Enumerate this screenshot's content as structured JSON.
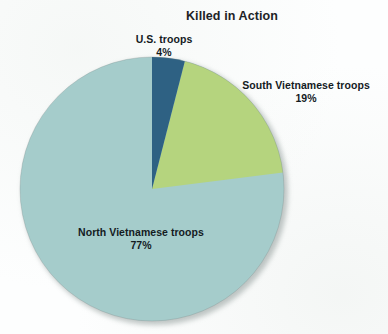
{
  "chart_data": {
    "type": "pie",
    "title": "Killed in Action",
    "subtitle": "",
    "xlabel": "",
    "ylabel": "",
    "legend_position": "none",
    "grid": false,
    "categories": [
      "U.S. troops",
      "South Vietnamese troops",
      "North Vietnamese troops"
    ],
    "values": [
      4,
      19,
      77
    ],
    "unit": "%",
    "value_labels": [
      "4%",
      "19%",
      "77%"
    ],
    "colors": [
      "#2e6183",
      "#b5d47e",
      "#a5cccb"
    ],
    "start_angle_deg": 0,
    "direction": "clockwise",
    "slices": [
      {
        "name": "U.S. troops",
        "value": 4,
        "value_label": "4%",
        "color": "#2e6183",
        "label_position": "outside-top"
      },
      {
        "name": "South Vietnamese troops",
        "value": 19,
        "value_label": "19%",
        "color": "#b5d47e",
        "label_position": "outside-right"
      },
      {
        "name": "North Vietnamese troops",
        "value": 77,
        "value_label": "77%",
        "color": "#a5cccb",
        "label_position": "inside-bottom-left"
      }
    ],
    "annotations": []
  },
  "title": {
    "text": "Killed in Action"
  },
  "labels": {
    "us": {
      "name": "U.S. troops",
      "pct": "4%"
    },
    "south": {
      "name": "South Vietnamese troops",
      "pct": "19%"
    },
    "north": {
      "name": "North Vietnamese troops",
      "pct": "77%"
    }
  }
}
